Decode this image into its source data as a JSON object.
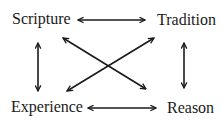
{
  "diagram": {
    "type": "quadrilateral",
    "nodes": {
      "scripture": "Scripture",
      "tradition": "Tradition",
      "experience": "Experience",
      "reason": "Reason"
    },
    "edges": [
      {
        "from": "Scripture",
        "to": "Tradition",
        "direction": "bidirectional"
      },
      {
        "from": "Scripture",
        "to": "Experience",
        "direction": "bidirectional"
      },
      {
        "from": "Tradition",
        "to": "Reason",
        "direction": "bidirectional"
      },
      {
        "from": "Experience",
        "to": "Reason",
        "direction": "bidirectional"
      },
      {
        "from": "Scripture",
        "to": "Reason",
        "direction": "bidirectional"
      },
      {
        "from": "Experience",
        "to": "Tradition",
        "direction": "bidirectional"
      }
    ],
    "colors": {
      "stroke": "#1a1a1a",
      "background": "#ffffff"
    }
  }
}
